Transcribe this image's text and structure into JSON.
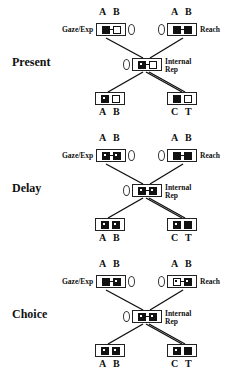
{
  "figure": {
    "panels": [
      {
        "label": "Present",
        "gaze": {
          "label": "Gaze/Exp",
          "letters": [
            "A",
            "B"
          ],
          "cells": [
            "filled",
            "empty"
          ]
        },
        "reach": {
          "label": "Reach",
          "letters": [
            "A",
            "B"
          ],
          "cells": [
            "filled",
            "filled"
          ]
        },
        "internal": {
          "label_line1": "Internal",
          "label_line2": "Rep",
          "cells": [
            "dotted",
            "empty"
          ]
        },
        "stim_ab": {
          "letters": [
            "A",
            "B"
          ],
          "cells": [
            "dotted",
            "empty"
          ]
        },
        "stim_ct": {
          "letters": [
            "C",
            "T"
          ],
          "cells": [
            "filled",
            "empty"
          ]
        }
      },
      {
        "label": "Delay",
        "gaze": {
          "label": "Gaze/Exp",
          "letters": [
            "A",
            "B"
          ],
          "cells": [
            "dotted",
            "dotted"
          ]
        },
        "reach": {
          "label": "Reach",
          "letters": [
            "A",
            "B"
          ],
          "cells": [
            "filled",
            "filled"
          ]
        },
        "internal": {
          "label_line1": "Internal",
          "label_line2": "Rep",
          "cells": [
            "dotted",
            "dotted"
          ]
        },
        "stim_ab": {
          "letters": [
            "A",
            "B"
          ],
          "cells": [
            "dotted",
            "dotted"
          ]
        },
        "stim_ct": {
          "letters": [
            "C",
            "T"
          ],
          "cells": [
            "dotted",
            "filled"
          ]
        }
      },
      {
        "label": "Choice",
        "gaze": {
          "label": "Gaze/Exp",
          "letters": [
            "A",
            "B"
          ],
          "cells": [
            "filled",
            "dotted"
          ]
        },
        "reach": {
          "label": "Reach",
          "letters": [
            "A",
            "B"
          ],
          "cells": [
            "empty-dot",
            "dotted"
          ]
        },
        "internal": {
          "label_line1": "Internal",
          "label_line2": "Rep",
          "cells": [
            "dotted",
            "dotted"
          ]
        },
        "stim_ab": {
          "letters": [
            "A",
            "B"
          ],
          "cells": [
            "dotted",
            "dotted"
          ]
        },
        "stim_ct": {
          "letters": [
            "C",
            "T"
          ],
          "cells": [
            "dotted",
            "filled"
          ]
        }
      }
    ]
  }
}
